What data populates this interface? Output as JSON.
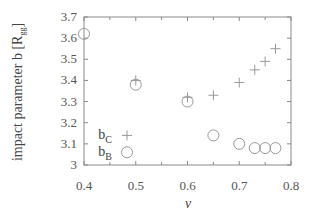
{
  "chart_data": {
    "type": "scatter",
    "title": "",
    "xlabel": "v",
    "ylabel": "impact parameter b [R",
    "ylabel_sub": "gg",
    "ylabel_end": "]",
    "xlim": [
      0.4,
      0.8
    ],
    "ylim": [
      3.0,
      3.7
    ],
    "xticks": [
      "0.4",
      "0.5",
      "0.6",
      "0.7",
      "0.8"
    ],
    "xtick_values": [
      0.4,
      0.5,
      0.6,
      0.7,
      0.8
    ],
    "yticks": [
      "3",
      "3.1",
      "3.2",
      "3.3",
      "3.4",
      "3.5",
      "3.6",
      "3.7"
    ],
    "ytick_values": [
      3.0,
      3.1,
      3.2,
      3.3,
      3.4,
      3.5,
      3.6,
      3.7
    ],
    "grid": false,
    "legend_position": "bottom-left",
    "series": [
      {
        "name": "b_C",
        "label_main": "b",
        "label_sub": "C",
        "marker": "plus",
        "x": [
          0.5,
          0.6,
          0.65,
          0.7,
          0.73,
          0.75,
          0.77
        ],
        "y": [
          3.4,
          3.32,
          3.33,
          3.39,
          3.45,
          3.49,
          3.55
        ]
      },
      {
        "name": "b_B",
        "label_main": "b",
        "label_sub": "B",
        "marker": "circle",
        "x": [
          0.4,
          0.5,
          0.6,
          0.65,
          0.7,
          0.73,
          0.75,
          0.77
        ],
        "y": [
          3.62,
          3.38,
          3.3,
          3.14,
          3.1,
          3.08,
          3.08,
          3.08
        ]
      }
    ],
    "colors": {
      "axis": "#888888",
      "marker": "#999999",
      "text": "#555555"
    }
  }
}
